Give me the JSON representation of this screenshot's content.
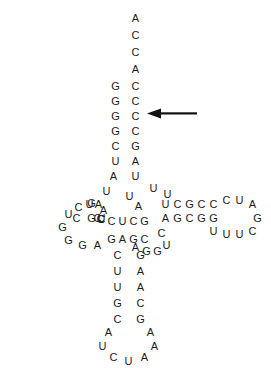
{
  "figure": {
    "width": 271,
    "height": 368,
    "background_color": "#ffffff",
    "base_color": "#1a1a1a",
    "font_size_px": 11
  },
  "annotations": {
    "arrow": {
      "name": "left-pointing-arrow",
      "direction": "left",
      "color": "#111111",
      "x": 147,
      "y": 108,
      "width": 50,
      "height": 11,
      "points_at": "acceptor-stem-row-6"
    }
  },
  "regions": [
    {
      "id": "acceptor-stem-3prime-tail",
      "label": "3' ACCA tail"
    },
    {
      "id": "acceptor-stem",
      "label": "Acceptor stem"
    },
    {
      "id": "d-arm",
      "label": "D-arm (dihydrouridine arm)"
    },
    {
      "id": "t-arm",
      "label": "T-arm (TψC arm)"
    },
    {
      "id": "variable-loop",
      "label": "Variable loop"
    },
    {
      "id": "anticodon-stem",
      "label": "Anticodon stem"
    },
    {
      "id": "anticodon-loop",
      "label": "Anticodon loop"
    }
  ],
  "bases": [
    {
      "id": "b001",
      "region": "acceptor-stem-3prime-tail",
      "letter": "A",
      "x": 130,
      "y": 13
    },
    {
      "id": "b002",
      "region": "acceptor-stem-3prime-tail",
      "letter": "C",
      "x": 130,
      "y": 30
    },
    {
      "id": "b003",
      "region": "acceptor-stem-3prime-tail",
      "letter": "C",
      "x": 130,
      "y": 47
    },
    {
      "id": "b004",
      "region": "acceptor-stem-3prime-tail",
      "letter": "A",
      "x": 130,
      "y": 64
    },
    {
      "id": "b005",
      "region": "acceptor-stem",
      "letter": "C",
      "x": 130,
      "y": 81
    },
    {
      "id": "b006",
      "region": "acceptor-stem",
      "letter": "C",
      "x": 130,
      "y": 96
    },
    {
      "id": "b007",
      "region": "acceptor-stem",
      "letter": "C",
      "x": 130,
      "y": 111
    },
    {
      "id": "b008",
      "region": "acceptor-stem",
      "letter": "C",
      "x": 130,
      "y": 126
    },
    {
      "id": "b009",
      "region": "acceptor-stem",
      "letter": "G",
      "x": 130,
      "y": 141
    },
    {
      "id": "b010",
      "region": "acceptor-stem",
      "letter": "A",
      "x": 130,
      "y": 156
    },
    {
      "id": "b011",
      "region": "acceptor-stem",
      "letter": "U",
      "x": 130,
      "y": 171
    },
    {
      "id": "b012",
      "region": "acceptor-stem",
      "letter": "G",
      "x": 110,
      "y": 81
    },
    {
      "id": "b013",
      "region": "acceptor-stem",
      "letter": "G",
      "x": 110,
      "y": 96
    },
    {
      "id": "b014",
      "region": "acceptor-stem",
      "letter": "G",
      "x": 110,
      "y": 111
    },
    {
      "id": "b015",
      "region": "acceptor-stem",
      "letter": "G",
      "x": 110,
      "y": 126
    },
    {
      "id": "b016",
      "region": "acceptor-stem",
      "letter": "C",
      "x": 110,
      "y": 141
    },
    {
      "id": "b017",
      "region": "acceptor-stem",
      "letter": "U",
      "x": 110,
      "y": 156
    },
    {
      "id": "b018",
      "region": "acceptor-stem",
      "letter": "A",
      "x": 108,
      "y": 171
    },
    {
      "id": "b019",
      "region": "acceptor-stem",
      "letter": "U",
      "x": 101,
      "y": 186
    },
    {
      "id": "b020",
      "region": "d-arm",
      "letter": "A",
      "x": 93,
      "y": 199
    },
    {
      "id": "b021",
      "region": "d-arm",
      "letter": "G",
      "x": 86,
      "y": 213
    },
    {
      "id": "b022",
      "region": "d-arm",
      "letter": "C",
      "x": 71,
      "y": 213
    },
    {
      "id": "b023",
      "region": "d-arm",
      "letter": "U",
      "x": 84,
      "y": 199
    },
    {
      "id": "b024",
      "region": "d-arm",
      "letter": "U",
      "x": 96,
      "y": 213
    },
    {
      "id": "b025",
      "region": "d-arm",
      "letter": "C",
      "x": 92,
      "y": 213
    },
    {
      "id": "b101",
      "region": "d-arm",
      "letter": "C",
      "x": 96,
      "y": 214
    },
    {
      "id": "b030",
      "region": "d-arm",
      "letter": "C",
      "x": 95,
      "y": 214
    },
    {
      "id": "b040",
      "region": "d-arm",
      "letter": "U",
      "x": 63,
      "y": 209
    },
    {
      "id": "b041",
      "region": "d-arm",
      "letter": "C",
      "x": 73,
      "y": 202
    },
    {
      "id": "b042",
      "region": "d-arm",
      "letter": "G",
      "x": 86,
      "y": 198
    },
    {
      "id": "b043",
      "region": "d-arm",
      "letter": "A",
      "x": 98,
      "y": 205
    },
    {
      "id": "b044",
      "region": "d-arm",
      "letter": "G",
      "x": 57,
      "y": 222
    },
    {
      "id": "b045",
      "region": "d-arm",
      "letter": "G",
      "x": 63,
      "y": 235
    },
    {
      "id": "b046",
      "region": "d-arm",
      "letter": "G",
      "x": 77,
      "y": 240
    },
    {
      "id": "b047",
      "region": "d-arm",
      "letter": "A",
      "x": 92,
      "y": 240
    },
    {
      "id": "b048",
      "region": "d-arm",
      "letter": "C",
      "x": 106,
      "y": 216
    },
    {
      "id": "b049",
      "region": "d-arm",
      "letter": "U",
      "x": 117,
      "y": 216
    },
    {
      "id": "b050",
      "region": "d-arm",
      "letter": "C",
      "x": 128,
      "y": 216
    },
    {
      "id": "b051",
      "region": "d-arm",
      "letter": "G",
      "x": 139,
      "y": 216
    },
    {
      "id": "b052",
      "region": "d-arm",
      "letter": "G",
      "x": 106,
      "y": 234
    },
    {
      "id": "b053",
      "region": "d-arm",
      "letter": "A",
      "x": 117,
      "y": 234
    },
    {
      "id": "b054",
      "region": "d-arm",
      "letter": "G",
      "x": 128,
      "y": 234
    },
    {
      "id": "b055",
      "region": "d-arm",
      "letter": "C",
      "x": 139,
      "y": 234
    },
    {
      "id": "b056",
      "region": "d-arm",
      "letter": "A",
      "x": 133,
      "y": 201
    },
    {
      "id": "b057",
      "region": "d-arm",
      "letter": "U",
      "x": 124,
      "y": 191
    },
    {
      "id": "b060",
      "region": "acceptor-stem",
      "letter": "U",
      "x": 148,
      "y": 183
    },
    {
      "id": "b061",
      "region": "acceptor-stem",
      "letter": "U",
      "x": 162,
      "y": 189
    },
    {
      "id": "b070",
      "region": "t-arm",
      "letter": "U",
      "x": 160,
      "y": 199
    },
    {
      "id": "b071",
      "region": "t-arm",
      "letter": "C",
      "x": 172,
      "y": 199
    },
    {
      "id": "b072",
      "region": "t-arm",
      "letter": "G",
      "x": 184,
      "y": 199
    },
    {
      "id": "b073",
      "region": "t-arm",
      "letter": "C",
      "x": 196,
      "y": 199
    },
    {
      "id": "b074",
      "region": "t-arm",
      "letter": "C",
      "x": 208,
      "y": 199
    },
    {
      "id": "b075",
      "region": "t-arm",
      "letter": "C",
      "x": 221,
      "y": 195
    },
    {
      "id": "b076",
      "region": "t-arm",
      "letter": "U",
      "x": 234,
      "y": 195
    },
    {
      "id": "b077",
      "region": "t-arm",
      "letter": "A",
      "x": 247,
      "y": 199
    },
    {
      "id": "b078",
      "region": "t-arm",
      "letter": "G",
      "x": 252,
      "y": 213
    },
    {
      "id": "b079",
      "region": "t-arm",
      "letter": "C",
      "x": 247,
      "y": 226
    },
    {
      "id": "b080",
      "region": "t-arm",
      "letter": "U",
      "x": 234,
      "y": 229
    },
    {
      "id": "b081",
      "region": "t-arm",
      "letter": "U",
      "x": 221,
      "y": 229
    },
    {
      "id": "b082",
      "region": "t-arm",
      "letter": "U",
      "x": 208,
      "y": 226
    },
    {
      "id": "b083",
      "region": "t-arm",
      "letter": "A",
      "x": 160,
      "y": 213
    },
    {
      "id": "b084",
      "region": "t-arm",
      "letter": "G",
      "x": 172,
      "y": 213
    },
    {
      "id": "b085",
      "region": "t-arm",
      "letter": "C",
      "x": 184,
      "y": 213
    },
    {
      "id": "b086",
      "region": "t-arm",
      "letter": "G",
      "x": 196,
      "y": 213
    },
    {
      "id": "b087",
      "region": "t-arm",
      "letter": "G",
      "x": 208,
      "y": 213
    },
    {
      "id": "b090",
      "region": "variable-loop",
      "letter": "C",
      "x": 156,
      "y": 228
    },
    {
      "id": "b091",
      "region": "variable-loop",
      "letter": "U",
      "x": 161,
      "y": 240
    },
    {
      "id": "b092",
      "region": "variable-loop",
      "letter": "G",
      "x": 152,
      "y": 246
    },
    {
      "id": "b093",
      "region": "variable-loop",
      "letter": "G",
      "x": 141,
      "y": 246
    },
    {
      "id": "b094",
      "region": "variable-loop",
      "letter": "A",
      "x": 130,
      "y": 242
    },
    {
      "id": "b110",
      "region": "anticodon-stem",
      "letter": "C",
      "x": 112,
      "y": 250
    },
    {
      "id": "b111",
      "region": "anticodon-stem",
      "letter": "U",
      "x": 112,
      "y": 266
    },
    {
      "id": "b112",
      "region": "anticodon-stem",
      "letter": "U",
      "x": 112,
      "y": 282
    },
    {
      "id": "b113",
      "region": "anticodon-stem",
      "letter": "G",
      "x": 112,
      "y": 298
    },
    {
      "id": "b114",
      "region": "anticodon-stem",
      "letter": "C",
      "x": 112,
      "y": 314
    },
    {
      "id": "b115",
      "region": "anticodon-stem",
      "letter": "G",
      "x": 135,
      "y": 250
    },
    {
      "id": "b116",
      "region": "anticodon-stem",
      "letter": "A",
      "x": 135,
      "y": 266
    },
    {
      "id": "b117",
      "region": "anticodon-stem",
      "letter": "A",
      "x": 135,
      "y": 282
    },
    {
      "id": "b118",
      "region": "anticodon-stem",
      "letter": "C",
      "x": 135,
      "y": 298
    },
    {
      "id": "b119",
      "region": "anticodon-stem",
      "letter": "G",
      "x": 135,
      "y": 314
    },
    {
      "id": "b120",
      "region": "anticodon-loop",
      "letter": "A",
      "x": 103,
      "y": 327
    },
    {
      "id": "b121",
      "region": "anticodon-loop",
      "letter": "U",
      "x": 97,
      "y": 341
    },
    {
      "id": "b122",
      "region": "anticodon-loop",
      "letter": "C",
      "x": 108,
      "y": 352
    },
    {
      "id": "b123",
      "region": "anticodon-loop",
      "letter": "U",
      "x": 123,
      "y": 356
    },
    {
      "id": "b124",
      "region": "anticodon-loop",
      "letter": "A",
      "x": 139,
      "y": 352
    },
    {
      "id": "b125",
      "region": "anticodon-loop",
      "letter": "A",
      "x": 149,
      "y": 341
    },
    {
      "id": "b126",
      "region": "anticodon-loop",
      "letter": "A",
      "x": 145,
      "y": 327
    }
  ]
}
